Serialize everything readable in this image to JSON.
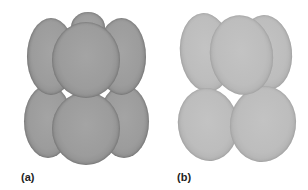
{
  "figure": {
    "panels": [
      {
        "id": "a",
        "label": "(a)",
        "description": "Close-packed arrangement of spherical particles, two layers",
        "sphere_color": "#9c9c9c",
        "count": 7
      },
      {
        "id": "b",
        "label": "(b)",
        "description": "Arrangement of elongated ellipsoidal particles, two layers",
        "sphere_color": "#bdbdbd",
        "count": 5
      }
    ]
  }
}
